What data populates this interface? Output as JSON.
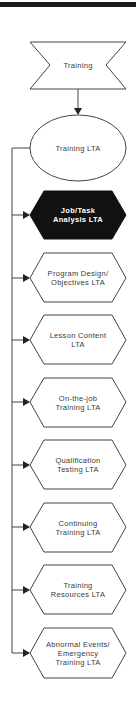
{
  "diagram": {
    "root": {
      "label": "Training",
      "shape": "bowtie"
    },
    "parent": {
      "label": "Training LTA",
      "shape": "ellipse"
    },
    "children": [
      {
        "label": "Job/Task\nAnalysis LTA",
        "highlighted": true
      },
      {
        "label": "Program Design/\nObjectives LTA",
        "highlighted": false
      },
      {
        "label": "Lesson Content\nLTA",
        "highlighted": false
      },
      {
        "label": "On-the-job\nTraining LTA",
        "highlighted": false
      },
      {
        "label": "Qualification\nTesting LTA",
        "highlighted": false
      },
      {
        "label": "Continuing\nTraining LTA",
        "highlighted": false
      },
      {
        "label": "Training\nResources LTA",
        "highlighted": false
      },
      {
        "label": "Abnormal Events/\nEmergency\nTraining LTA",
        "highlighted": false
      }
    ]
  },
  "colors": {
    "stroke": "#444444",
    "highlight_fill": "#111111",
    "fill": "#ffffff",
    "text": "#3a3a3a"
  }
}
